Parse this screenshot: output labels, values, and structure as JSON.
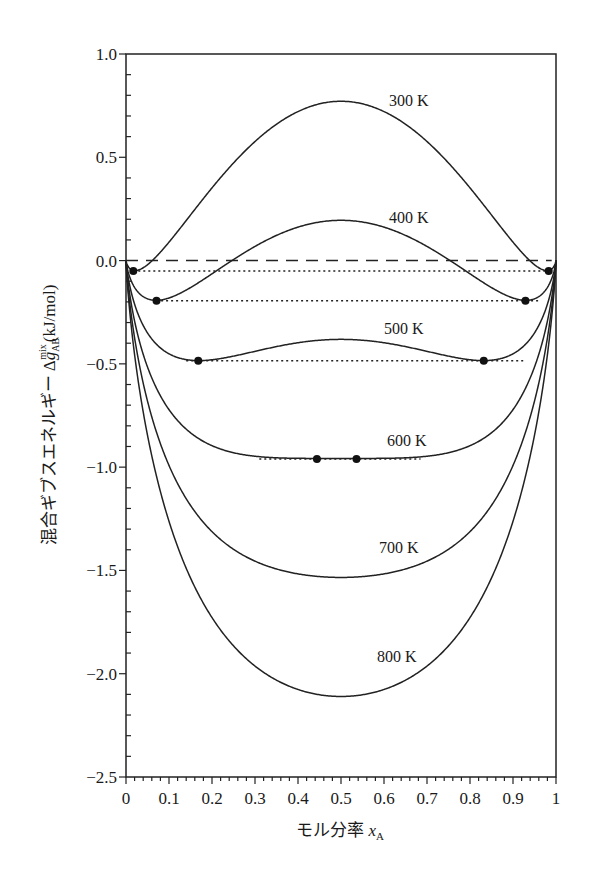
{
  "chart_data": {
    "type": "line",
    "title": "",
    "xlabel": "モル分率 x_A",
    "xlabel_parts": {
      "text": "モル分率 ",
      "var": "x",
      "sub": "A"
    },
    "ylabel": "混合ギブスエネルギー Δg_AB^mix (kJ/mol)",
    "ylabel_parts": {
      "text": "混合ギブスエネルギー Δ",
      "var": "g",
      "sub": "AB",
      "sup": "mix",
      "unit": "(kJ/mol)"
    },
    "xlim": [
      0,
      1
    ],
    "ylim": [
      -2.5,
      1.0
    ],
    "x_ticks": [
      "0",
      "0.1",
      "0.2",
      "0.3",
      "0.4",
      "0.5",
      "0.6",
      "0.7",
      "0.8",
      "0.9",
      "1"
    ],
    "y_ticks": [
      "1.0",
      "0.5",
      "0.0",
      "−0.5",
      "−1.0",
      "−1.5",
      "−2.0",
      "−2.5"
    ],
    "y_tick_values": [
      1.0,
      0.5,
      0.0,
      -0.5,
      -1.0,
      -1.5,
      -2.0,
      -2.5
    ],
    "grid": false,
    "legend": "inline labels",
    "model": {
      "omega_kJ_per_mol": 10.0,
      "R_kJ_per_mol_K": 0.008314
    },
    "x": [
      0,
      0.01,
      0.02,
      0.05,
      0.1,
      0.15,
      0.2,
      0.25,
      0.3,
      0.35,
      0.4,
      0.45,
      0.5,
      0.55,
      0.6,
      0.65,
      0.7,
      0.75,
      0.8,
      0.85,
      0.9,
      0.95,
      0.98,
      0.99,
      1
    ],
    "series": [
      {
        "name": "300 K",
        "T": 300,
        "values": [
          0,
          -0.04,
          -0.05,
          -0.03,
          0.09,
          0.25,
          0.4,
          0.53,
          0.64,
          0.71,
          0.75,
          0.77,
          0.77,
          0.77,
          0.75,
          0.71,
          0.64,
          0.53,
          0.4,
          0.25,
          0.09,
          -0.03,
          -0.05,
          -0.04,
          0
        ],
        "label_pos": [
          389,
          106
        ]
      },
      {
        "name": "400 K",
        "T": 400,
        "values": [
          0,
          -0.08,
          -0.13,
          -0.19,
          -0.18,
          -0.1,
          -0.02,
          0.05,
          0.11,
          0.16,
          0.18,
          0.2,
          0.2,
          0.2,
          0.18,
          0.16,
          0.11,
          0.05,
          -0.02,
          -0.1,
          -0.18,
          -0.19,
          -0.13,
          -0.08,
          0
        ],
        "label_pos": [
          389,
          223
        ]
      },
      {
        "name": "500 K",
        "T": 500,
        "values": [
          0,
          -0.13,
          -0.2,
          -0.33,
          -0.45,
          -0.48,
          -0.48,
          -0.46,
          -0.44,
          -0.41,
          -0.39,
          -0.38,
          -0.38,
          -0.38,
          -0.39,
          -0.41,
          -0.44,
          -0.46,
          -0.48,
          -0.48,
          -0.45,
          -0.33,
          -0.2,
          -0.13,
          0
        ],
        "label_pos": [
          384,
          334
        ]
      },
      {
        "name": "600 K",
        "T": 600,
        "values": [
          0,
          -0.18,
          -0.28,
          -0.47,
          -0.72,
          -0.86,
          -0.92,
          -0.95,
          -0.96,
          -0.96,
          -0.96,
          -0.96,
          -0.96,
          -0.96,
          -0.96,
          -0.96,
          -0.96,
          -0.95,
          -0.92,
          -0.86,
          -0.72,
          -0.47,
          -0.28,
          -0.18,
          0
        ],
        "label_pos": [
          387,
          446
        ]
      },
      {
        "name": "700 K",
        "T": 700,
        "values": [
          0,
          -0.22,
          -0.36,
          -0.62,
          -0.99,
          -1.22,
          -1.37,
          -1.46,
          -1.51,
          -1.53,
          -1.53,
          -1.53,
          -1.53,
          -1.53,
          -1.53,
          -1.53,
          -1.51,
          -1.46,
          -1.37,
          -1.22,
          -0.99,
          -0.62,
          -0.36,
          -0.22,
          0
        ],
        "label_pos": [
          379,
          553
        ]
      },
      {
        "name": "800 K",
        "T": 800,
        "values": [
          0,
          -0.27,
          -0.44,
          -0.77,
          -1.26,
          -1.59,
          -1.82,
          -1.97,
          -2.07,
          -2.12,
          -2.13,
          -2.12,
          -2.11,
          -2.12,
          -2.13,
          -2.12,
          -2.07,
          -1.97,
          -1.82,
          -1.59,
          -1.26,
          -0.77,
          -0.44,
          -0.27,
          0
        ],
        "label_pos": [
          377,
          662
        ]
      }
    ],
    "reference_lines": [
      {
        "name": "zero",
        "style": "dashed",
        "y": 0.0,
        "x_range": [
          0,
          0.99
        ]
      }
    ],
    "common_tangents": [
      {
        "T": 300,
        "y": -0.05,
        "x_range": [
          0.017,
          0.983
        ],
        "points": [
          [
            0.017,
            -0.05
          ],
          [
            0.983,
            -0.05
          ]
        ]
      },
      {
        "T": 400,
        "y": -0.195,
        "x_range": [
          0.07,
          0.965
        ],
        "points": [
          [
            0.071,
            -0.195
          ],
          [
            0.929,
            -0.195
          ]
        ]
      },
      {
        "T": 500,
        "y": -0.485,
        "x_range": [
          0.14,
          0.925
        ],
        "points": [
          [
            0.168,
            -0.485
          ],
          [
            0.832,
            -0.485
          ]
        ]
      },
      {
        "T": 600,
        "y": -0.96,
        "x_range": [
          0.31,
          0.685
        ],
        "points": [
          [
            0.444,
            -0.96
          ],
          [
            0.536,
            -0.96
          ]
        ]
      }
    ]
  }
}
